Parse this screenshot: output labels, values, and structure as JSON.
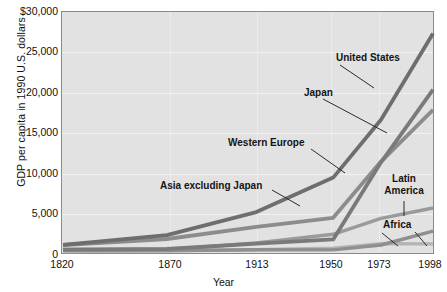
{
  "chart_data": {
    "type": "line",
    "title": "",
    "xlabel": "Year",
    "ylabel": "GDP per capita in 1990 U.S. dollars",
    "x": [
      1820,
      1870,
      1913,
      1950,
      1973,
      1998
    ],
    "xtick_labels": [
      "1820",
      "1870",
      "1913",
      "1950",
      "1973",
      "1998"
    ],
    "ylim": [
      0,
      30000
    ],
    "yticks": [
      0,
      5000,
      10000,
      15000,
      20000,
      25000,
      30000
    ],
    "ytick_labels": [
      "0",
      "5,000",
      "10,000",
      "15,000",
      "20,000",
      "25,000",
      "$30,000"
    ],
    "grid": true,
    "legend_position": "inline-annotations",
    "series": [
      {
        "name": "United States",
        "values": [
          1250,
          2450,
          5300,
          9560,
          16700,
          27330
        ]
      },
      {
        "name": "Japan",
        "values": [
          670,
          740,
          1390,
          1920,
          11440,
          20410
        ]
      },
      {
        "name": "Western Europe",
        "values": [
          1230,
          1970,
          3470,
          4590,
          11530,
          17920
        ]
      },
      {
        "name": "Latin America",
        "values": [
          690,
          680,
          1480,
          2550,
          4530,
          5800
        ]
      },
      {
        "name": "Asia excluding Japan",
        "values": [
          575,
          545,
          640,
          635,
          1230,
          2940
        ]
      },
      {
        "name": "Africa",
        "values": [
          420,
          500,
          640,
          850,
          1410,
          1370
        ]
      }
    ],
    "annotations": [
      {
        "label": "United States",
        "series": "United States"
      },
      {
        "label": "Japan",
        "series": "Japan"
      },
      {
        "label": "Western Europe",
        "series": "Western Europe"
      },
      {
        "label": "Asia excluding Japan",
        "series": "Asia excluding Japan"
      },
      {
        "label": "Latin\nAmerica",
        "series": "Latin America",
        "line1": "Latin",
        "line2": "America"
      },
      {
        "label": "Africa",
        "series": "Africa"
      }
    ],
    "colors": {
      "plot_background": "#e2e2e2",
      "axis": "#8a8a8a",
      "united_states": "#6e6e6e",
      "japan": "#7a7a7a",
      "western_europe": "#8c8c8c",
      "latin_america": "#9a9a9a",
      "asia_excluding_japan": "#8f8f8f",
      "africa": "#b4b4b4",
      "text": "#141414"
    }
  }
}
